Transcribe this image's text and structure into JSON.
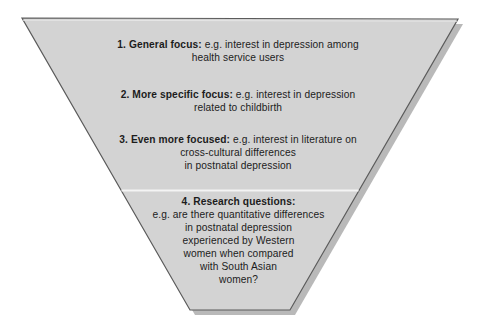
{
  "figure": {
    "name": "research-focus-funnel",
    "shape": "inverted-triangle-funnel",
    "fill_color": "#d3d3d3",
    "outline_color": "#5a5a5a",
    "shadow_color": "#b5b5b5",
    "divider_color": "#f2f2f2",
    "background_color": "#ffffff",
    "text_color": "#1c1c1c"
  },
  "stages": [
    {
      "number": "1.",
      "lead": "1. General focus:",
      "body": " e.g. interest in depression among health service users",
      "lines": [
        "1. General focus: e.g. interest in depression among",
        "health service users"
      ],
      "line1_bold": "1. General focus:",
      "line1_rest": " e.g. interest in depression among",
      "line2": "health service users"
    },
    {
      "number": "2.",
      "lead": "2. More specific focus:",
      "body": " e.g. interest in depression related to childbirth",
      "lines": [
        "2. More specific focus: e.g. interest in depression",
        "related to childbirth"
      ],
      "line1_bold": "2. More specific focus:",
      "line1_rest": " e.g. interest in depression",
      "line2": "related to childbirth"
    },
    {
      "number": "3.",
      "lead": "3. Even more focused:",
      "body": " e.g. interest in literature on cross-cultural differences in postnatal depression",
      "lines": [
        "3. Even more focused: e.g. interest in literature on",
        "cross-cultural differences",
        "in postnatal depression"
      ],
      "line1_bold": "3. Even more focused:",
      "line1_rest": " e.g. interest in literature on",
      "line2": "cross-cultural differences",
      "line3": "in postnatal depression"
    },
    {
      "number": "4.",
      "lead": "4. Research questions:",
      "body": "e.g. are there quantitative differences in postnatal depression experienced by Western women when compared with South Asian women?",
      "lines": [
        "4. Research questions:",
        "e.g. are there quantitative differences",
        "in postnatal depression",
        "experienced by Western",
        "women when compared",
        "with South Asian",
        "women?"
      ],
      "line1_bold": "4. Research questions:",
      "line2": "e.g. are there quantitative differences",
      "line3": "in postnatal depression",
      "line4": "experienced by Western",
      "line5": "women when compared",
      "line6": "with South Asian",
      "line7": "women?"
    }
  ]
}
